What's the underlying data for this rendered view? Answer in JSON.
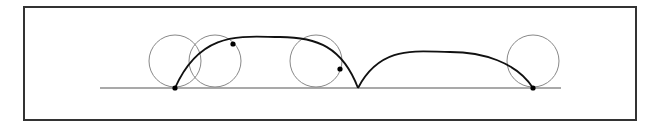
{
  "diagram": {
    "type": "rolling-circle-trajectory",
    "frame": {
      "x": 24,
      "y": 7,
      "width": 612,
      "height": 113,
      "stroke": "#333333"
    },
    "baseline": {
      "x1": 100,
      "x2": 561,
      "y": 88,
      "stroke": "#555555"
    },
    "circles": [
      {
        "cx": 175,
        "cy": 61,
        "r": 26
      },
      {
        "cx": 215,
        "cy": 61,
        "r": 26
      },
      {
        "cx": 316,
        "cy": 61,
        "r": 26
      },
      {
        "cx": 533,
        "cy": 61,
        "r": 26
      }
    ],
    "circle_stroke": "#888888",
    "curve_stroke": "#111111",
    "arches": [
      {
        "start": [
          175,
          88
        ],
        "peak": [
          280,
          37
        ],
        "end": [
          358,
          88
        ]
      },
      {
        "start": [
          358,
          88
        ],
        "peak": [
          450,
          52
        ],
        "end": [
          533,
          88
        ]
      }
    ],
    "points": [
      {
        "x": 175,
        "y": 88
      },
      {
        "x": 233,
        "y": 44
      },
      {
        "x": 340,
        "y": 69
      },
      {
        "x": 533,
        "y": 88
      }
    ]
  }
}
